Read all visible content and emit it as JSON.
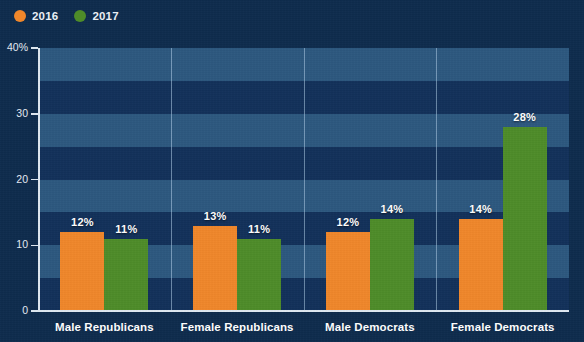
{
  "legend": {
    "items": [
      {
        "label": "2016",
        "color": "#F0872B",
        "marker": "circle-marker"
      },
      {
        "label": "2017",
        "color": "#4E8C29",
        "marker": "circle-marker"
      }
    ]
  },
  "axis": {
    "y_ticks": [
      "40%",
      "30",
      "20",
      "10",
      "0"
    ]
  },
  "colors": {
    "background": "#0e2c4d",
    "band_light": "#2d587f",
    "band_dark": "#12315a",
    "axis_line": "#dfe9f2",
    "gridline": "#b0cde8",
    "series_2016": "#F0872B",
    "series_2017": "#4E8C29",
    "text": "#ffffff"
  },
  "chart_data": {
    "type": "bar",
    "title": "",
    "subtitle": "",
    "xlabel": "",
    "ylabel": "",
    "ylim": [
      0,
      40
    ],
    "yticks": [
      0,
      10,
      20,
      30,
      40
    ],
    "ytick_labels": [
      "0",
      "10",
      "20",
      "30",
      "40%"
    ],
    "grid": "horizontal-bands",
    "legend_position": "top-left",
    "categories": [
      "Male Republicans",
      "Female Republicans",
      "Male Democrats",
      "Female Democrats"
    ],
    "series": [
      {
        "name": "2016",
        "color": "#F0872B",
        "values": [
          12,
          13,
          12,
          14
        ],
        "labels": [
          "12%",
          "13%",
          "12%",
          "14%"
        ]
      },
      {
        "name": "2017",
        "color": "#4E8C29",
        "values": [
          11,
          11,
          14,
          28
        ],
        "labels": [
          "11%",
          "11%",
          "14%",
          "28%"
        ]
      }
    ]
  }
}
